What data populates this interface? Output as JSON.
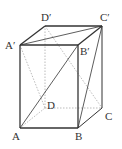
{
  "diagram": {
    "vertices": {
      "A": {
        "label": "A",
        "x": 20,
        "y": 128
      },
      "B": {
        "label": "B",
        "x": 78,
        "y": 128
      },
      "C": {
        "label": "C",
        "x": 102,
        "y": 108
      },
      "D": {
        "label": "D",
        "x": 45,
        "y": 108
      },
      "A1": {
        "label": "A′",
        "x": 20,
        "y": 45
      },
      "B1": {
        "label": "B′",
        "x": 78,
        "y": 45
      },
      "C1": {
        "label": "C′",
        "x": 102,
        "y": 26
      },
      "D1": {
        "label": "D′",
        "x": 45,
        "y": 26
      }
    },
    "solid_edges": [
      "AB",
      "BC",
      "AA1",
      "BB1",
      "CC1",
      "A1B1",
      "B1C1",
      "C1D1",
      "D1A1",
      "A1C1",
      "AB1",
      "BC1"
    ],
    "dashed_edges": [
      "AD",
      "DC",
      "DD1",
      "A1D",
      "D1C"
    ],
    "colors": {
      "line": "#333333",
      "dashed": "#999999"
    }
  }
}
